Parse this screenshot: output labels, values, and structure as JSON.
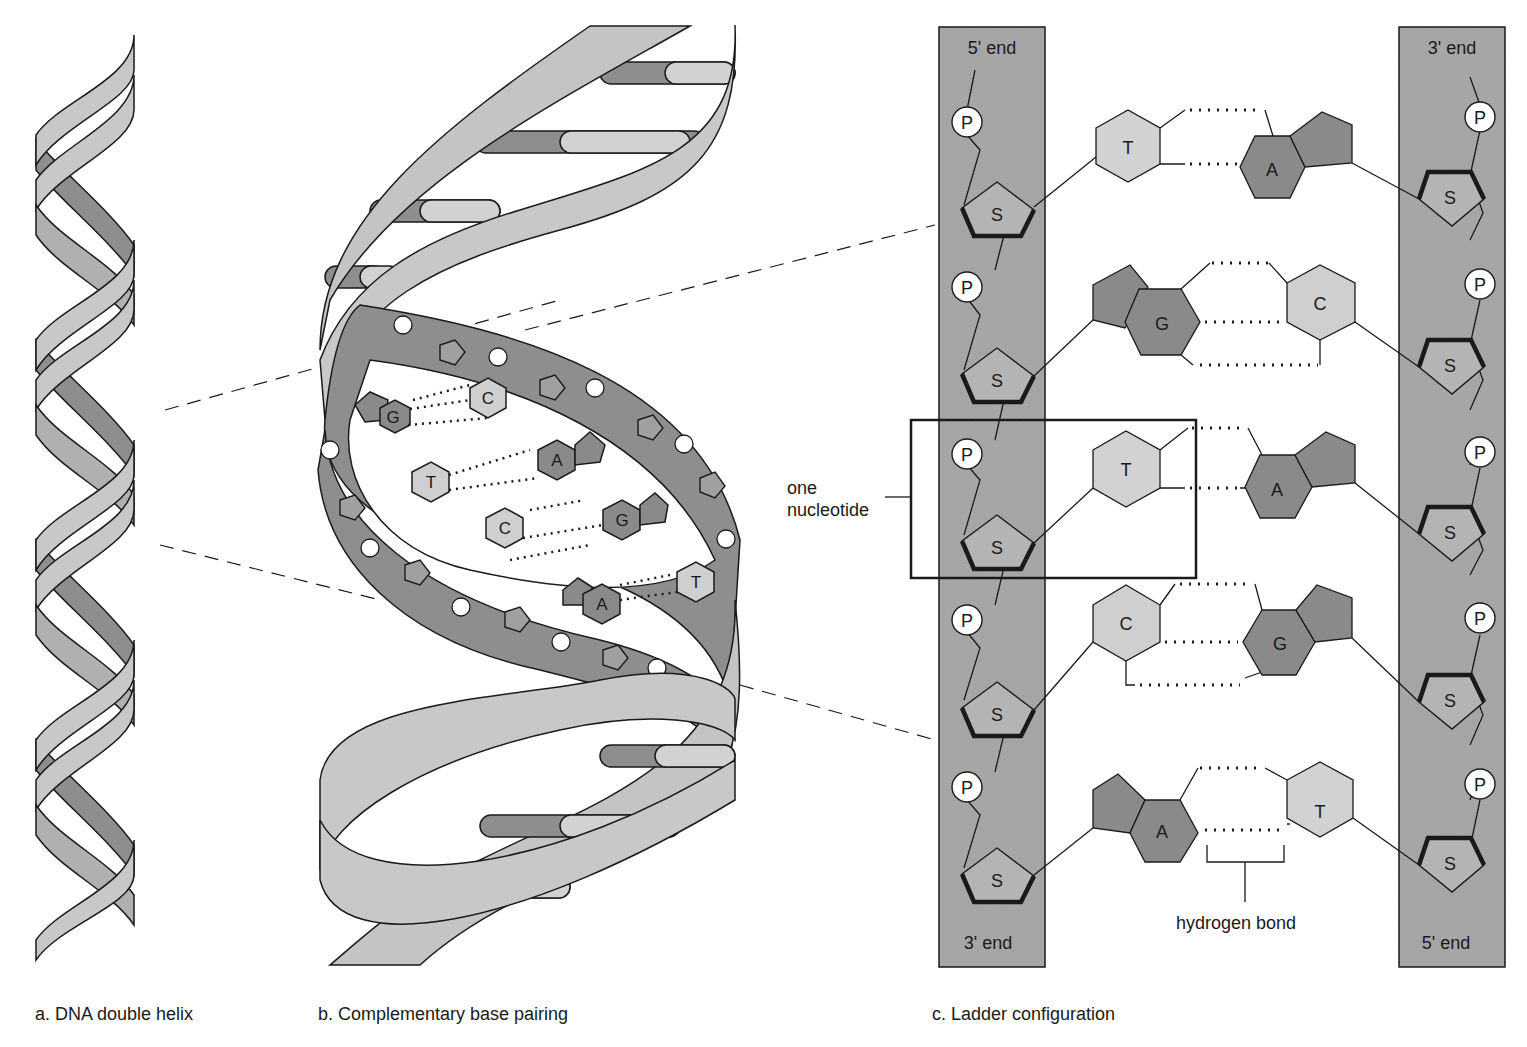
{
  "figure": {
    "panels": [
      {
        "id": "a",
        "caption": "a. DNA double helix"
      },
      {
        "id": "b",
        "caption": "b. Complementary base pairing"
      },
      {
        "id": "c",
        "caption": "c. Ladder configuration"
      }
    ]
  },
  "colors": {
    "backbone_light": "#c8c8c8",
    "backbone_dark": "#8e8e8e",
    "strand_column": "#a9a9a9",
    "purine": "#8a8a8a",
    "pyrimidine": "#cfcfcf",
    "sugar": "#b4b4b4",
    "phosphate": "#ffffff",
    "outline": "#1a1a1a"
  },
  "panel_b": {
    "base_pairs": [
      {
        "left": "G",
        "right": "C"
      },
      {
        "left": "T",
        "right": "A"
      },
      {
        "left": "C",
        "right": "G"
      },
      {
        "left": "A",
        "right": "T"
      }
    ]
  },
  "panel_c": {
    "left_strand": {
      "top_label": "5' end",
      "bottom_label": "3' end"
    },
    "right_strand": {
      "top_label": "3' end",
      "bottom_label": "5' end"
    },
    "phosphate_label": "P",
    "sugar_label": "S",
    "rows": [
      {
        "left_base": "T",
        "right_base": "A",
        "bonds": 2
      },
      {
        "left_base": "G",
        "right_base": "C",
        "bonds": 3
      },
      {
        "left_base": "T",
        "right_base": "A",
        "bonds": 2
      },
      {
        "left_base": "C",
        "right_base": "G",
        "bonds": 3
      },
      {
        "left_base": "A",
        "right_base": "T",
        "bonds": 2
      }
    ],
    "annotations": {
      "nucleotide_line1": "one",
      "nucleotide_line2": "nucleotide",
      "hydrogen_bond": "hydrogen bond"
    }
  }
}
